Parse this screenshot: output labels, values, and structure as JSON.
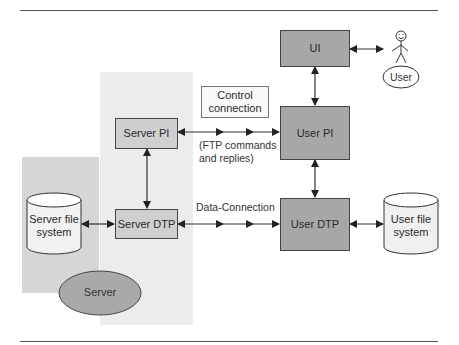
{
  "diagram": {
    "nodes": {
      "ui": {
        "label": "UI"
      },
      "user_pi": {
        "label": "User PI"
      },
      "user_dtp": {
        "label": "User DTP"
      },
      "server_pi": {
        "label": "Server PI"
      },
      "server_dtp": {
        "label": "Server DTP"
      },
      "server_fs": {
        "line1": "Server file",
        "line2": "system"
      },
      "user_fs": {
        "line1": "User file",
        "line2": "system"
      },
      "server": {
        "label": "Server"
      },
      "user": {
        "label": "User"
      }
    },
    "labels": {
      "control_connection": {
        "line1": "Control",
        "line2": "connection"
      },
      "ftp_commands": {
        "line1": "(FTP commands",
        "line2": "and replies)"
      },
      "data_connection": "Data-Connection"
    },
    "colors": {
      "dark_box": "#a7a7a7",
      "light_box": "#cfcfcf",
      "panel_light": "#ececec",
      "panel_dark": "#d6d6d6",
      "server_ellipse": "#a9a9a9",
      "line": "#333333"
    }
  }
}
